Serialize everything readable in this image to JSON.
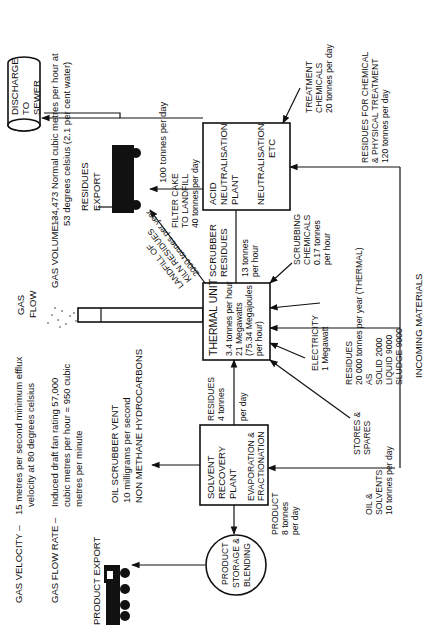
{
  "diagram": {
    "type": "process-flow",
    "orientation": "rotated-90-ccw",
    "header_notes": {
      "gas_velocity_label": "GAS VELOCITY –",
      "gas_velocity_line1": "15 metres per second minimum efflux",
      "gas_velocity_line2": "velocity at 80 degrees celsius",
      "gas_flow_rate_label": "GAS FLOW RATE –",
      "gas_flow_rate_line1": "Induced draft fan rating 57,000",
      "gas_flow_rate_line2": "cubic metres per hour = 950 cubic",
      "gas_flow_rate_line3": "metres per minute",
      "gas_volume_label": "GAS VOLUME –",
      "gas_volume_line1": "134,473 Normal cubic metres per hour at",
      "gas_volume_line2": "53 degrees celsius (2.1 per cent water)",
      "gas_flow": [
        "GAS",
        "FLOW"
      ]
    },
    "nodes": {
      "thermal_unit": {
        "title": "THERMAL  UNIT",
        "lines": [
          "3.4 tonnes per hour",
          "21 Megawatts",
          "(75.34 Megajoules",
          "per hour)"
        ]
      },
      "acid_neutralisation": {
        "lines": [
          "ACID",
          "NEUTRALISATION",
          "PLANT"
        ],
        "lines2": [
          "NEUTRALISATION",
          "ETC"
        ]
      },
      "solvent_recovery": {
        "lines": [
          "SOLVENT",
          "RECOVERY",
          "PLANT"
        ],
        "lines2": [
          "EVAPORATION &",
          "FRACTIONATION"
        ]
      },
      "product_storage": {
        "lines": [
          "PRODUCT",
          "STORAGE &",
          "BLENDING"
        ]
      },
      "discharge": {
        "lines": [
          "DISCHARGE",
          "TO",
          "SEWER"
        ]
      },
      "product_export": {
        "label": "PRODUCT EXPORT"
      },
      "residues_export": {
        "lines": [
          "RESIDUES",
          "EXPORT"
        ]
      }
    },
    "flows": {
      "oil_scrubber_vent": [
        "OIL SCRUBBER VENT",
        "10 milligrams per second",
        "NON METHANE HYDROCARBONS"
      ],
      "residues_4": [
        "RESIDUES",
        "4 tonnes",
        "per day"
      ],
      "product_8": [
        "PRODUCT",
        "8 tonnes",
        "per day"
      ],
      "stores_spares": [
        "STORES &",
        "SPARES"
      ],
      "oil_solvents": [
        "OIL &",
        "SOLVENTS",
        "10 tonnes per day"
      ],
      "electricity": [
        "ELECTRICITY",
        "1 Megawatt"
      ],
      "residues_main": [
        "RESIDUES",
        "20 000 tonnes per year (THERMAL)",
        "AS",
        "SOLID  2000",
        "LIQUID 9000",
        "SLUDGE 9000"
      ],
      "scrubbing_chemicals": [
        "SCRUBBING",
        "CHEMICALS",
        "0.17 tonnes",
        "per hour"
      ],
      "scrubber_residues": [
        "SCRUBBER",
        "RESIDUES"
      ],
      "scrubber_13": [
        "13 tonnes",
        "per hour"
      ],
      "landfill_kiln": [
        "LANDFILL OF",
        "KILN RESIDUES",
        "2000 tonnes per year"
      ],
      "filter_cake": [
        "FILTER CAKE",
        "TO LANDFILL",
        "40 tonnes per day"
      ],
      "discharge_100": "100 tonnes per day",
      "treatment_chemicals": [
        "TREATMENT",
        "CHEMICALS",
        "20 tonnes per day"
      ],
      "residues_chemical": [
        "RESIDUES FOR CHEMICAL",
        "& PHYSICAL TREATMENT",
        "120 tonnes per day"
      ],
      "incoming_materials": "INCOMING MATERIALS"
    },
    "colors": {
      "ink": "#111111",
      "paper": "#ffffff"
    }
  }
}
